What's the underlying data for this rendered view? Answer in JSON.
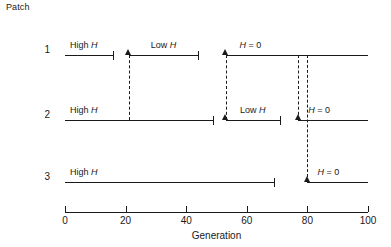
{
  "figure": {
    "patch_axis_title": "Patch",
    "x_axis_title": "Generation",
    "rows": [
      {
        "label": "1",
        "segments": [
          {
            "label_prefix": "High ",
            "label_italic": "H",
            "start": 0,
            "end": 16,
            "start_marker": "none",
            "end_marker": "tick"
          },
          {
            "label_prefix": "Low ",
            "label_italic": "H",
            "start": 21,
            "end": 44,
            "start_marker": "arrow",
            "end_marker": "tick"
          },
          {
            "label_prefix": "",
            "label_italic": "H",
            "label_suffix": " = 0",
            "start": 53,
            "end": 100,
            "start_marker": "arrow",
            "end_marker": "none"
          }
        ]
      },
      {
        "label": "2",
        "segments": [
          {
            "label_prefix": "High ",
            "label_italic": "H",
            "start": 0,
            "end": 49,
            "start_marker": "none",
            "end_marker": "tick"
          },
          {
            "label_prefix": "Low ",
            "label_italic": "H",
            "start": 53,
            "end": 71,
            "start_marker": "arrow",
            "end_marker": "tick"
          },
          {
            "label_prefix": "",
            "label_italic": "H",
            "label_suffix": " = 0",
            "start": 77,
            "end": 100,
            "start_marker": "arrow",
            "end_marker": "none"
          }
        ]
      },
      {
        "label": "3",
        "segments": [
          {
            "label_prefix": "High ",
            "label_italic": "H",
            "start": 0,
            "end": 69,
            "start_marker": "none",
            "end_marker": "tick"
          },
          {
            "label_prefix": "",
            "label_italic": "H",
            "label_suffix": " = 0",
            "start": 80,
            "end": 100,
            "start_marker": "arrow",
            "end_marker": "none"
          }
        ]
      }
    ],
    "dashed_connectors": [
      {
        "x": 21,
        "from_row": 0,
        "to_row": 1
      },
      {
        "x": 53,
        "from_row": 0,
        "to_row": 1
      },
      {
        "x": 77,
        "from_row": 0,
        "to_row": 1
      },
      {
        "x": 80,
        "from_row": 0,
        "to_row": 2
      }
    ],
    "x_ticks": [
      0,
      20,
      40,
      60,
      80,
      100
    ],
    "x_range": [
      0,
      100
    ],
    "colors": {
      "ink": "#1a1a1a",
      "background": "#ffffff"
    }
  },
  "chart_data": {
    "type": "timeline",
    "title": "",
    "xlabel": "Generation",
    "ylabel": "Patch",
    "xlim": [
      0,
      100
    ],
    "grid": false,
    "legend": "none",
    "categories": [
      "1",
      "2",
      "3"
    ],
    "series": [
      {
        "name": "Patch 1",
        "intervals": [
          {
            "label": "High H",
            "start": 0,
            "end": 16
          },
          {
            "label": "Low H",
            "start": 21,
            "end": 44
          },
          {
            "label": "H = 0",
            "start": 53,
            "end": 100
          }
        ]
      },
      {
        "name": "Patch 2",
        "intervals": [
          {
            "label": "High H",
            "start": 0,
            "end": 49
          },
          {
            "label": "Low H",
            "start": 53,
            "end": 71
          },
          {
            "label": "H = 0",
            "start": 77,
            "end": 100
          }
        ]
      },
      {
        "name": "Patch 3",
        "intervals": [
          {
            "label": "High H",
            "start": 0,
            "end": 69
          },
          {
            "label": "H = 0",
            "start": 80,
            "end": 100
          }
        ]
      }
    ],
    "annotations": [
      {
        "type": "dashed-connector",
        "x": 21,
        "from": "Patch 1",
        "to": "Patch 2"
      },
      {
        "type": "dashed-connector",
        "x": 53,
        "from": "Patch 1",
        "to": "Patch 2"
      },
      {
        "type": "dashed-connector",
        "x": 77,
        "from": "Patch 1",
        "to": "Patch 2"
      },
      {
        "type": "dashed-connector",
        "x": 80,
        "from": "Patch 1",
        "to": "Patch 3"
      }
    ]
  }
}
